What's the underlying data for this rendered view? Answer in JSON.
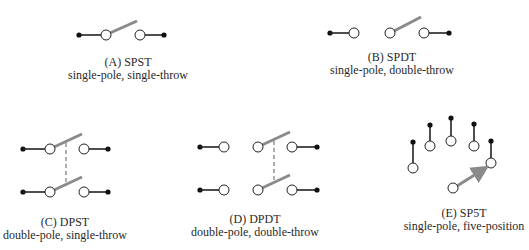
{
  "colors": {
    "wire": "#222222",
    "arm": "#8a8a8a",
    "contact_fill": "#ffffff",
    "dot": "#111111"
  },
  "switches": [
    {
      "id": "A",
      "title": "(A) SPST",
      "subtitle": "single-pole, single-throw"
    },
    {
      "id": "B",
      "title": "(B) SPDT",
      "subtitle": "single-pole, double-throw"
    },
    {
      "id": "C",
      "title": "(C) DPST",
      "subtitle": "double-pole, single-throw"
    },
    {
      "id": "D",
      "title": "(D) DPDT",
      "subtitle": "double-pole, double-throw"
    },
    {
      "id": "E",
      "title": "(E) SP5T",
      "subtitle": "single-pole, five-position"
    }
  ]
}
